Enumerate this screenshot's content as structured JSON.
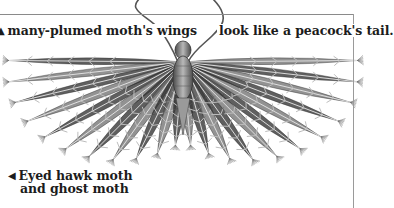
{
  "document": {
    "type": "scanned book page illustration",
    "subject": "many-plumed moth"
  },
  "captions": {
    "top_left": {
      "pointer_icon": "triangle-up-icon",
      "pointer_glyph": "▲",
      "text": "many-plumed moth's wings"
    },
    "top_right": {
      "text": "look like a peacock's tail."
    },
    "bottom_left": {
      "pointer_icon": "triangle-left-icon",
      "pointer_glyph": "◀",
      "line1": "Eyed hawk moth",
      "line2": "and ghost moth"
    }
  },
  "illustration": {
    "description": "Engraved drawing of a many-plumed moth with fan-shaped feathered wings spread wide, antennae curling upward",
    "colors": {
      "ink": "#2a2a2a",
      "mid": "#6e6e6e",
      "light": "#bdbdbd",
      "rule": "#8a8a8a"
    }
  }
}
